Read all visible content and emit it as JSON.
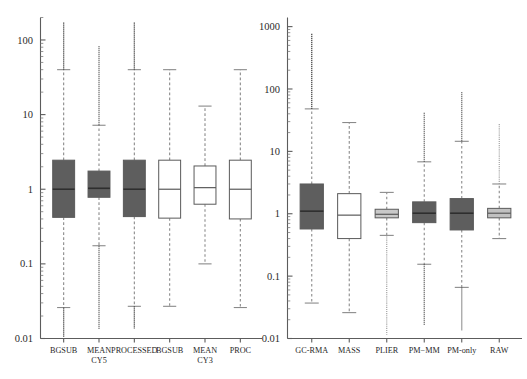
{
  "figure": {
    "title": "",
    "panel_count": 2
  },
  "chart_data": [
    {
      "type": "boxplot",
      "panel": "left",
      "title": "",
      "xlabel": "",
      "ylabel": "",
      "yscale": "log",
      "ylim": [
        0.01,
        200
      ],
      "ytick_labels": [
        "0.01",
        "0.1",
        "1",
        "10",
        "100"
      ],
      "ytick_values": [
        0.01,
        0.1,
        1,
        10,
        100
      ],
      "grid": false,
      "legend": "none",
      "categories": [
        "BGSUB",
        "MEAN CY5",
        "PROCESSED",
        "BGSUB",
        "MEAN CY3",
        "PROC"
      ],
      "category_lines": [
        [
          "BGSUB",
          ""
        ],
        [
          "MEAN",
          "CY5"
        ],
        [
          "PROCESSED",
          ""
        ],
        [
          "BGSUB",
          ""
        ],
        [
          "MEAN",
          "CY3"
        ],
        [
          "PROC",
          ""
        ]
      ],
      "boxes": [
        {
          "label": "BGSUB",
          "fill": "#5e5e5e",
          "q1": 0.42,
          "median": 1.0,
          "q3": 2.45,
          "whisker_low": 0.026,
          "whisker_high": 40.0,
          "outlier_low": 0.0105,
          "outlier_high": 175.0
        },
        {
          "label": "MEAN CY5",
          "fill": "#5e5e5e",
          "q1": 0.78,
          "median": 1.03,
          "q3": 1.75,
          "whisker_low": 0.175,
          "whisker_high": 7.2,
          "outlier_low": 0.0135,
          "outlier_high": 83.0
        },
        {
          "label": "PROCESSED",
          "fill": "#5e5e5e",
          "q1": 0.43,
          "median": 1.0,
          "q3": 2.45,
          "whisker_low": 0.027,
          "whisker_high": 40.0,
          "outlier_low": 0.0135,
          "outlier_high": 175.0
        },
        {
          "label": "BGSUB",
          "fill": "#ffffff",
          "q1": 0.41,
          "median": 1.0,
          "q3": 2.45,
          "whisker_low": 0.027,
          "whisker_high": 40.0,
          "outlier_low": null,
          "outlier_high": null
        },
        {
          "label": "MEAN CY3",
          "fill": "#ffffff",
          "q1": 0.63,
          "median": 1.05,
          "q3": 2.05,
          "whisker_low": 0.1,
          "whisker_high": 13.0,
          "outlier_low": null,
          "outlier_high": null
        },
        {
          "label": "PROC",
          "fill": "#ffffff",
          "q1": 0.4,
          "median": 1.0,
          "q3": 2.45,
          "whisker_low": 0.026,
          "whisker_high": 40.0,
          "outlier_low": null,
          "outlier_high": null
        }
      ]
    },
    {
      "type": "boxplot",
      "panel": "right",
      "title": "",
      "xlabel": "",
      "ylabel": "",
      "yscale": "log",
      "ylim": [
        0.01,
        1400
      ],
      "ytick_labels": [
        "0.01",
        "0.1",
        "1",
        "10",
        "100",
        "1000"
      ],
      "ytick_values": [
        0.01,
        0.1,
        1,
        10,
        100,
        1000
      ],
      "grid": false,
      "legend": "none",
      "categories": [
        "GC-RMA",
        "MASS",
        "PLIER",
        "PM−MM",
        "PM-only",
        "RAW"
      ],
      "category_lines": [
        [
          "GC-RMA",
          ""
        ],
        [
          "MASS",
          ""
        ],
        [
          "PLIER",
          ""
        ],
        [
          "PM−MM",
          ""
        ],
        [
          "PM-only",
          ""
        ],
        [
          "RAW",
          ""
        ]
      ],
      "boxes": [
        {
          "label": "GC-RMA",
          "fill": "#5e5e5e",
          "q1": 0.57,
          "median": 1.1,
          "q3": 3.0,
          "whisker_low": 0.037,
          "whisker_high": 48.0,
          "outlier_low": null,
          "outlier_high": 780.0
        },
        {
          "label": "MASS",
          "fill": "#ffffff",
          "q1": 0.4,
          "median": 0.95,
          "q3": 2.1,
          "whisker_low": 0.026,
          "whisker_high": 29.0,
          "outlier_low": null,
          "outlier_high": null
        },
        {
          "label": "PLIER",
          "fill": "#c9c9c9",
          "q1": 0.86,
          "median": 0.98,
          "q3": 1.18,
          "whisker_low": 0.45,
          "whisker_high": 2.2,
          "outlier_low": 0.0115,
          "outlier_high": null
        },
        {
          "label": "PM−MM",
          "fill": "#5e5e5e",
          "q1": 0.72,
          "median": 1.02,
          "q3": 1.55,
          "whisker_low": 0.155,
          "whisker_high": 6.8,
          "outlier_low": 0.0165,
          "outlier_high": 43.0
        },
        {
          "label": "PM-only",
          "fill": "#5e5e5e",
          "q1": 0.55,
          "median": 1.02,
          "q3": 1.75,
          "whisker_low": 0.066,
          "whisker_high": 14.5,
          "outlier_low": 0.0135,
          "outlier_high": 92.0
        },
        {
          "label": "RAW",
          "fill": "#c1c1c1",
          "q1": 0.86,
          "median": 1.02,
          "q3": 1.22,
          "whisker_low": 0.4,
          "whisker_high": 3.0,
          "outlier_low": null,
          "outlier_high": 28.0
        }
      ]
    }
  ],
  "colors": {
    "box_dark": "#5e5e5e",
    "box_white": "#ffffff",
    "box_light": "#c9c9c9",
    "axis": "#5c5c5c",
    "whisker": "#8a8a8a",
    "median": "#2e2e2e",
    "background": "#ffffff"
  }
}
